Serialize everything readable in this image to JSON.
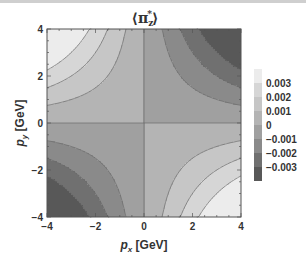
{
  "chart_data": {
    "type": "heatmap",
    "subtype": "contour",
    "xlabel": "p_x [GeV]",
    "ylabel": "p_y [GeV]",
    "xlim": [
      -4,
      4
    ],
    "ylim": [
      -4,
      4
    ],
    "xticks": [
      "-4",
      "-2",
      "0",
      "2",
      "4"
    ],
    "yticks": [
      "4",
      "2",
      "0",
      "-2",
      "-4"
    ],
    "function_shape": "proportional to -p_x * p_y (saddle), negative in top-left and bottom-right, positive in top-right and bottom-left",
    "contour_levels": [
      -0.003,
      -0.002,
      -0.001,
      0,
      0.001,
      0.002,
      0.003
    ],
    "legend": {
      "labels": [
        "0.003",
        "0.002",
        "0.001",
        "0",
        "-0.001",
        "-0.002",
        "-0.003"
      ],
      "colors": [
        "#ececec",
        "#d6d6d6",
        "#c6c6c6",
        "#b4b4b4",
        "#a0a0a0",
        "#8a8a8a",
        "#707070",
        "#585858"
      ]
    },
    "grid": false
  },
  "title_main": "⟨π",
  "title_sub": "z",
  "title_sup": "*",
  "title_close": "⟩",
  "xlabel_main": "p",
  "xlabel_sub": "x",
  "xlabel_unit": " [GeV]",
  "ylabel_main": "p",
  "ylabel_sub": "y",
  "ylabel_unit": " [GeV]"
}
